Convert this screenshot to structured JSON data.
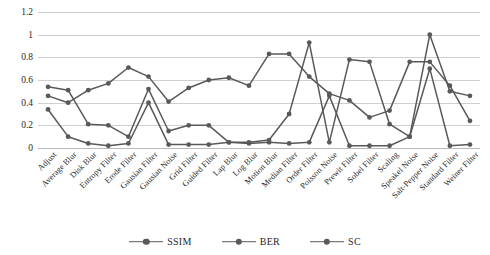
{
  "chart_data": {
    "type": "line",
    "title": "",
    "xlabel": "",
    "ylabel": "",
    "ylim": [
      0,
      1.2
    ],
    "yticks": [
      "0",
      "0.2",
      "0.4",
      "0.6",
      "0.8",
      "1",
      "1.2"
    ],
    "grid": true,
    "legend_position": "bottom-center",
    "series_color": "#595959",
    "categories": [
      "Adjust",
      "Average Blur",
      "Disk Blur",
      "Entropy Filter",
      "Erode Filter",
      "Gausian Filter",
      "Gausian Noise",
      "Grid Filter",
      "Guided Filter",
      "Lap Blur",
      "Log Blur",
      "Motion Blur",
      "Median Filter",
      "Order Filter",
      "Poisson Noise",
      "Prewit Filter",
      "Sobel Filter",
      "Scaling",
      "Speakel Noise",
      "Salt-Pepper Noise",
      "Standard Filter",
      "Weiner Filter"
    ],
    "series": [
      {
        "name": "SSIM",
        "values": [
          0.46,
          0.4,
          0.51,
          0.57,
          0.71,
          0.63,
          0.41,
          0.53,
          0.6,
          0.62,
          0.55,
          0.83,
          0.83,
          0.63,
          0.48,
          0.42,
          0.27,
          0.33,
          0.76,
          0.76,
          0.55,
          0.24
        ]
      },
      {
        "name": "BER",
        "values": [
          0.34,
          0.1,
          0.04,
          0.02,
          0.04,
          0.4,
          0.03,
          0.03,
          0.03,
          0.05,
          0.04,
          0.05,
          0.04,
          0.05,
          0.46,
          0.02,
          0.02,
          0.02,
          0.1,
          0.7,
          0.02,
          0.03
        ]
      },
      {
        "name": "SC",
        "values": [
          0.54,
          0.51,
          0.21,
          0.2,
          0.1,
          0.52,
          0.15,
          0.2,
          0.2,
          0.05,
          0.05,
          0.07,
          0.3,
          0.93,
          0.05,
          0.78,
          0.76,
          0.21,
          0.1,
          1.0,
          0.5,
          0.46
        ]
      }
    ]
  },
  "legend": {
    "items": [
      {
        "label": "SSIM"
      },
      {
        "label": "BER"
      },
      {
        "label": "SC"
      }
    ]
  },
  "top_strip": {
    "fragments": [
      "",
      "",
      "",
      ""
    ]
  }
}
